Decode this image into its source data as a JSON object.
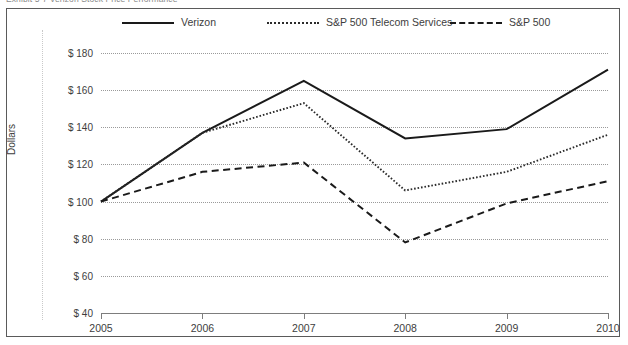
{
  "exhibit": {
    "title": "Exhibit 5-7  Verizon Stock Price Performance"
  },
  "legend": {
    "position": "top",
    "items": [
      {
        "label": "Verizon",
        "style": "solid",
        "color": "#1a1a1a"
      },
      {
        "label": "S&P 500 Telecom Services",
        "style": "dotted",
        "color": "#2b2b2b"
      },
      {
        "label": "S&P 500",
        "style": "dashed",
        "color": "#1a1a1a"
      }
    ]
  },
  "axes": {
    "y_title": "Dollars",
    "y_ticks": [
      "$ 180",
      "$ 160",
      "$ 140",
      "$ 120",
      "$ 100",
      "$ 80",
      "$ 60",
      "$ 40"
    ],
    "x_ticks": [
      "2005",
      "2006",
      "2007",
      "2008",
      "2009",
      "2010"
    ]
  },
  "chart_data": {
    "type": "line",
    "title": "Exhibit 5-7  Verizon Stock Price Performance",
    "xlabel": "",
    "ylabel": "Dollars",
    "x": [
      2005,
      2006,
      2007,
      2008,
      2009,
      2010
    ],
    "categories": [
      "2005",
      "2006",
      "2007",
      "2008",
      "2009",
      "2010"
    ],
    "ylim": [
      40,
      180
    ],
    "ytick_values": [
      180,
      160,
      140,
      120,
      100,
      80,
      60,
      40
    ],
    "grid": true,
    "legend_position": "top",
    "series": [
      {
        "name": "Verizon",
        "style": "solid",
        "color": "#1a1a1a",
        "values": [
          100,
          137,
          165,
          134,
          139,
          171
        ]
      },
      {
        "name": "S&P 500 Telecom Services",
        "style": "dotted",
        "color": "#2b2b2b",
        "values": [
          100,
          137,
          153,
          106,
          116,
          136
        ]
      },
      {
        "name": "S&P 500",
        "style": "dashed",
        "color": "#1a1a1a",
        "values": [
          100,
          116,
          121,
          78,
          99,
          111
        ]
      }
    ]
  }
}
